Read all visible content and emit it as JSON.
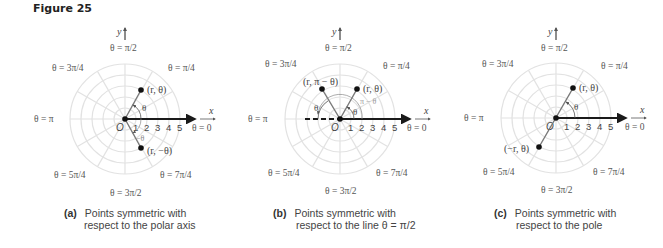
{
  "figure": {
    "title": "Figure 25"
  },
  "panels": [
    {
      "id": "a",
      "label": "(a)",
      "caption_line1": "Points symmetric with",
      "caption_line2": "respect to the polar axis",
      "origin_label": "O",
      "axis_x_label": "x",
      "axis_y_label": "y",
      "tick_labels": [
        "1",
        "2",
        "3",
        "4",
        "5"
      ],
      "angle_labels": {
        "top": "θ = π/2",
        "top_right": "θ = π/4",
        "right": "θ = 0",
        "bottom_right": "θ = 7π/4",
        "bottom": "θ = 3π/2",
        "bottom_left": "θ = 5π/4",
        "left": "θ = π",
        "top_left": "θ = 3π/4"
      },
      "points": [
        {
          "label": "(r, θ)"
        },
        {
          "label": "(r, −θ)"
        }
      ],
      "angle_marks": [
        "θ",
        "−θ"
      ]
    },
    {
      "id": "b",
      "label": "(b)",
      "caption_line1": "Points symmetric with",
      "caption_line2": "respect to the line θ = π/2",
      "origin_label": "O",
      "axis_x_label": "x",
      "axis_y_label": "y",
      "tick_labels": [
        "1",
        "2",
        "3",
        "4",
        "5"
      ],
      "angle_labels": {
        "top": "θ = π/2",
        "top_right": "θ = π/4",
        "right": "θ = 0",
        "bottom_right": "θ = 7π/4",
        "bottom": "θ = 3π/2",
        "bottom_left": "θ = 5π/4",
        "left": "θ = π",
        "top_left": "θ = 3π/4"
      },
      "points": [
        {
          "label": "(r, π − θ)"
        },
        {
          "label": "(r, θ)"
        }
      ],
      "angle_marks": [
        "θ",
        "θ",
        "π − θ"
      ]
    },
    {
      "id": "c",
      "label": "(c)",
      "caption_line1": "Points symmetric with",
      "caption_line2": "respect to the pole",
      "origin_label": "O",
      "axis_x_label": "x",
      "axis_y_label": "y",
      "tick_labels": [
        "1",
        "2",
        "3",
        "4",
        "5"
      ],
      "angle_labels": {
        "top": "θ = π/2",
        "top_right": "θ = π/4",
        "right": "θ = 0",
        "bottom_right": "θ = 7π/4",
        "bottom": "θ = 3π/2",
        "bottom_left": "θ = 5π/4",
        "left": "θ = π",
        "top_left": "θ = 3π/4"
      },
      "points": [
        {
          "label": "(r, θ)"
        },
        {
          "label": "(−r, θ)"
        }
      ],
      "angle_marks": [
        "θ"
      ]
    }
  ],
  "colors": {
    "grid": "#e2e2e2",
    "axis": "#1a1a1a",
    "ray": "#7a7a7a",
    "text": "#444444"
  }
}
